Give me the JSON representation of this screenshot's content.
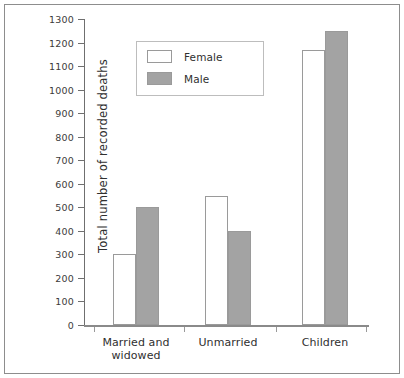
{
  "chart_data": {
    "type": "bar",
    "title": "",
    "xlabel": "",
    "ylabel": "Total number of recorded deaths",
    "categories": [
      "Married and widowed",
      "Unmarried",
      "Children"
    ],
    "category_lines": [
      [
        "Married and",
        "widowed"
      ],
      [
        "Unmarried"
      ],
      [
        "Children"
      ]
    ],
    "series": [
      {
        "name": "Female",
        "values": [
          300,
          550,
          1170
        ],
        "color": "#ffffff",
        "edge_color": "#9a9a9a"
      },
      {
        "name": "Male",
        "values": [
          500,
          400,
          1250
        ],
        "color": "#a3a3a3",
        "edge_color": "#9a9a9a"
      }
    ],
    "ylim": [
      0,
      1300
    ],
    "ytick_labels": [
      "0",
      "100",
      "200",
      "300",
      "400",
      "500",
      "600",
      "700",
      "800",
      "900",
      "1000",
      "1100",
      "1200",
      "1300"
    ],
    "ytick_values": [
      0,
      100,
      200,
      300,
      400,
      500,
      600,
      700,
      800,
      900,
      1000,
      1100,
      1200,
      1300
    ],
    "grid": false,
    "legend_position": "upper center",
    "legend_entries": [
      "Female",
      "Male"
    ]
  }
}
